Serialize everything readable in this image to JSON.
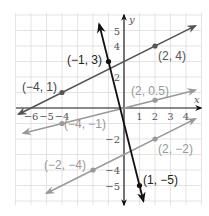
{
  "chart_data": {
    "type": "line",
    "title": "",
    "xlabel": "x",
    "ylabel": "y",
    "xlim": [
      -7,
      5
    ],
    "ylim": [
      -6,
      6
    ],
    "grid": true,
    "x_ticks": [
      "-6",
      "-5",
      "-4",
      "1",
      "2",
      "3",
      "4"
    ],
    "y_ticks": [
      "5",
      "4",
      "2",
      "-2",
      "-4",
      "-5"
    ],
    "series": [
      {
        "name": "line-a",
        "color": "#555555",
        "equation": "y = 0.5x + 3",
        "points": [
          [
            -4,
            1
          ],
          [
            2,
            4
          ]
        ],
        "labels": [
          "(−4, 1)",
          "(2, 4)"
        ]
      },
      {
        "name": "line-b",
        "color": "#999999",
        "equation": "y = 0.25x",
        "points": [
          [
            -4,
            -1
          ],
          [
            2,
            0.5
          ]
        ],
        "labels": [
          "(−4, −1)",
          "(2, 0.5)"
        ]
      },
      {
        "name": "line-c",
        "color": "#999999",
        "equation": "y = 0.5x - 3",
        "points": [
          [
            -2,
            -4
          ],
          [
            2,
            -2
          ]
        ],
        "labels": [
          "(−2, −4)",
          "(2, −2)"
        ]
      },
      {
        "name": "line-d",
        "color": "#111111",
        "equation": "y = -4x - 1",
        "points": [
          [
            -1,
            3
          ],
          [
            1,
            -5
          ]
        ],
        "labels": [
          "(−1, 3)",
          "(1, −5)"
        ]
      }
    ]
  },
  "axes": {
    "x_label": "x",
    "y_label": "y"
  },
  "ticks": {
    "x": [
      {
        "v": -6,
        "t": "−6"
      },
      {
        "v": -5,
        "t": "−5"
      },
      {
        "v": -4,
        "t": "−4"
      },
      {
        "v": 1,
        "t": "1"
      },
      {
        "v": 2,
        "t": "2"
      },
      {
        "v": 3,
        "t": "3"
      },
      {
        "v": 4,
        "t": "4"
      }
    ],
    "y": [
      {
        "v": 5,
        "t": "5"
      },
      {
        "v": 4,
        "t": "4"
      },
      {
        "v": 2,
        "t": "2"
      },
      {
        "v": -2,
        "t": "−2"
      },
      {
        "v": -4,
        "t": "−4"
      },
      {
        "v": -5,
        "t": "−5"
      }
    ]
  },
  "point_labels": {
    "p_m4_1": "(−4, 1)",
    "p_2_4": "(2, 4)",
    "p_m1_3": "(−1, 3)",
    "p_2_05": "(2, 0.5)",
    "p_m4_m1": "(−4, −1)",
    "p_m2_m4": "(−2, −4)",
    "p_2_m2": "(2, −2)",
    "p_1_m5": "(1, −5)"
  }
}
